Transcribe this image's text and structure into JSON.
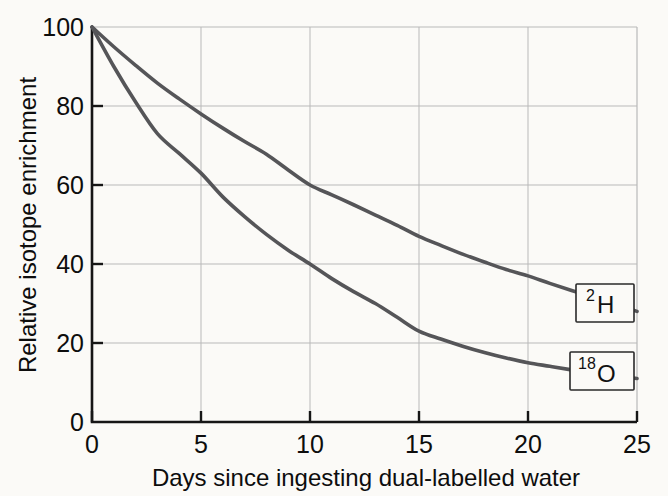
{
  "chart_data": {
    "type": "line",
    "title": "",
    "xlabel": "Days since ingesting dual-labelled water",
    "ylabel": "Relative isotope enrichment",
    "xlim": [
      0,
      25
    ],
    "ylim": [
      0,
      100
    ],
    "xticks": [
      0,
      5,
      10,
      15,
      20,
      25
    ],
    "yticks": [
      0,
      20,
      40,
      60,
      80,
      100
    ],
    "xtick_labels": [
      "0",
      "5",
      "10",
      "15",
      "20",
      "25"
    ],
    "ytick_labels": [
      "0",
      "20",
      "40",
      "60",
      "80",
      "100"
    ],
    "grid": true,
    "grid_color": "#b9b9b9",
    "legend_position": "inline-at-curve-end",
    "x": [
      0,
      1,
      2,
      3,
      4,
      5,
      6,
      7,
      8,
      9,
      10,
      11,
      12,
      13,
      14,
      15,
      16,
      17,
      18,
      19,
      20,
      21,
      22,
      23,
      24,
      25
    ],
    "series": [
      {
        "name": "2H",
        "label_superscript": "2",
        "label_base": "H",
        "color": "#555558",
        "values": [
          100,
          95.0,
          90.3,
          85.8,
          81.8,
          78.0,
          74.4,
          71.0,
          67.8,
          63.8,
          60.0,
          57.5,
          55.0,
          52.4,
          49.8,
          47.0,
          44.7,
          42.5,
          40.5,
          38.6,
          37.0,
          35.1,
          33.3,
          31.6,
          29.9,
          28.0
        ]
      },
      {
        "name": "18O",
        "label_superscript": "18",
        "label_base": "O",
        "color": "#555558",
        "values": [
          100,
          90.0,
          81.0,
          73.0,
          68.0,
          63.0,
          57.0,
          52.0,
          47.5,
          43.5,
          40.0,
          36.3,
          33.0,
          30.0,
          26.5,
          23.0,
          21.0,
          19.2,
          17.6,
          16.2,
          15.0,
          14.1,
          13.2,
          12.4,
          11.7,
          11.0
        ]
      }
    ],
    "annotations": [
      {
        "name": "2H-curve-label",
        "superscript": "2",
        "base": "H",
        "at_x": 22.3,
        "at_y": 33.5
      },
      {
        "name": "18O-curve-label",
        "superscript": "18",
        "base": "O",
        "at_x": 22.3,
        "at_y": 15.5
      }
    ]
  }
}
